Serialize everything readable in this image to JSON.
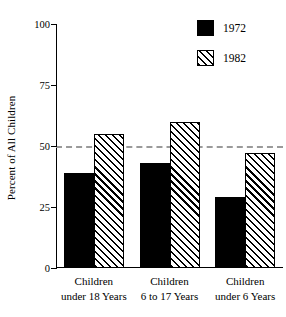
{
  "chart_data": {
    "type": "bar",
    "title": "",
    "xlabel": "",
    "ylabel": "Percent of All Children",
    "ylim": [
      0,
      100
    ],
    "yticks": [
      0,
      25,
      50,
      75,
      100
    ],
    "ytick_labels": [
      "0",
      "25",
      "50",
      "75",
      "100"
    ],
    "grid": false,
    "legend_position": "top-right",
    "categories": [
      "Children under 18 Years",
      "Children 6 to 17 Years",
      "Children under 6 Years"
    ],
    "category_lines": [
      {
        "line1": "Children",
        "line2": "under 18 Years"
      },
      {
        "line1": "Children",
        "line2": "6 to 17 Years"
      },
      {
        "line1": "Children",
        "line2": "under 6 Years"
      }
    ],
    "series": [
      {
        "name": "1972",
        "fill": "solid",
        "color": "#000000",
        "values": [
          39,
          43,
          29
        ]
      },
      {
        "name": "1982",
        "fill": "diagonal-hatch",
        "color": "#000000",
        "values": [
          55,
          60,
          47
        ]
      }
    ],
    "reference_line": {
      "value": 50,
      "style": "dashed",
      "color": "#9a9a9a"
    }
  },
  "legend": {
    "entries": [
      {
        "label": "1972",
        "fill": "solid"
      },
      {
        "label": "1982",
        "fill": "diagonal-hatch"
      }
    ]
  }
}
